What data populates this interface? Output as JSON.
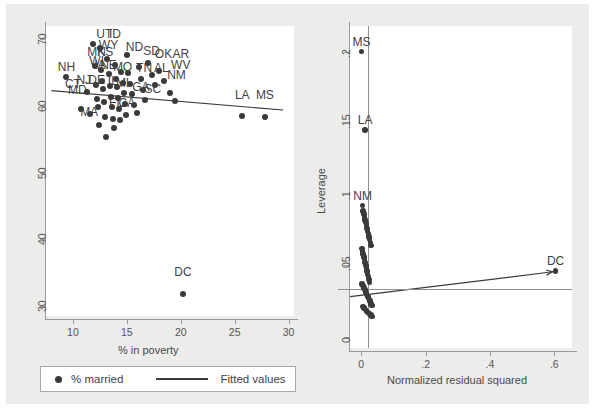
{
  "figure": {
    "background_color": "#ececeb",
    "plot_background": "#ffffff",
    "marker_color": "#3a3a3a",
    "axis_color": "#9a9a9a"
  },
  "legend": {
    "marker_label": "% married",
    "line_label": "Fitted values"
  },
  "chart_data": [
    {
      "type": "scatter",
      "panel": "left",
      "title": "",
      "xlabel": "% in poverty",
      "ylabel": "",
      "xlim": [
        7.5,
        30.5
      ],
      "ylim": [
        28.5,
        72.0
      ],
      "xticks": [
        "10",
        "15",
        "20",
        "25",
        "30"
      ],
      "xtick_values": [
        10,
        15,
        20,
        25,
        30
      ],
      "yticks": [
        "70",
        "60",
        "50",
        "40",
        "30"
      ],
      "ytick_values": [
        70,
        60,
        50,
        40,
        30
      ],
      "grid": false,
      "legend_position": "below",
      "series": [
        {
          "name": "% married",
          "x": [
            9.4,
            10.7,
            11.3,
            11.6,
            11.9,
            12.0,
            12.1,
            12.2,
            12.3,
            12.4,
            12.5,
            12.6,
            12.7,
            12.8,
            12.9,
            13.0,
            13.1,
            13.2,
            13.3,
            13.4,
            13.5,
            13.6,
            13.7,
            13.8,
            13.9,
            14.0,
            14.1,
            14.2,
            14.3,
            14.4,
            14.5,
            14.6,
            14.7,
            14.8,
            14.9,
            15.0,
            15.1,
            15.3,
            15.5,
            15.7,
            15.9,
            16.1,
            16.3,
            16.5,
            16.7,
            17.0,
            17.3,
            17.6,
            18.0,
            18.4,
            19.0,
            19.5,
            20.2,
            25.7,
            27.8
          ],
          "y": [
            64.3,
            59.6,
            62.1,
            58.8,
            69.3,
            66.0,
            63.2,
            61.0,
            59.9,
            57.2,
            68.7,
            65.4,
            63.8,
            62.5,
            60.6,
            58.4,
            55.3,
            67.0,
            64.8,
            63.0,
            61.4,
            59.8,
            58.0,
            56.7,
            66.2,
            64.1,
            62.8,
            61.2,
            59.5,
            57.9,
            65.1,
            63.4,
            62.0,
            60.3,
            58.6,
            67.6,
            64.9,
            63.3,
            61.8,
            60.1,
            58.9,
            65.8,
            64.0,
            62.4,
            60.9,
            66.4,
            64.6,
            63.1,
            65.2,
            63.7,
            62.0,
            60.7,
            31.8,
            58.5,
            58.3
          ],
          "marker": "filled-circle"
        }
      ],
      "fit_line": {
        "name": "Fitted values",
        "x0": 8.0,
        "y0": 62.3,
        "x1": 29.5,
        "y1": 59.4
      },
      "point_labels": [
        {
          "text": "UT",
          "x": 12.9,
          "y": 69.3
        },
        {
          "text": "ID",
          "x": 13.9,
          "y": 69.3
        },
        {
          "text": "NH",
          "x": 9.4,
          "y": 64.3
        },
        {
          "text": "WY",
          "x": 13.3,
          "y": 67.6
        },
        {
          "text": "MN",
          "x": 12.2,
          "y": 66.6
        },
        {
          "text": "KS",
          "x": 13.0,
          "y": 66.6
        },
        {
          "text": "ND",
          "x": 15.7,
          "y": 67.4
        },
        {
          "text": "SD",
          "x": 17.3,
          "y": 66.8
        },
        {
          "text": "OK",
          "x": 18.4,
          "y": 66.3
        },
        {
          "text": "AR",
          "x": 20.0,
          "y": 66.3
        },
        {
          "text": "WV",
          "x": 20.0,
          "y": 64.6
        },
        {
          "text": "WI",
          "x": 12.2,
          "y": 65.2
        },
        {
          "text": "IA",
          "x": 12.5,
          "y": 64.6
        },
        {
          "text": "NE",
          "x": 13.3,
          "y": 64.6
        },
        {
          "text": "MO",
          "x": 14.6,
          "y": 64.4
        },
        {
          "text": "TN",
          "x": 16.6,
          "y": 64.2
        },
        {
          "text": "AL",
          "x": 18.2,
          "y": 64.2
        },
        {
          "text": "NM",
          "x": 19.6,
          "y": 63.2
        },
        {
          "text": "CT",
          "x": 10.0,
          "y": 61.8
        },
        {
          "text": "NJ",
          "x": 11.0,
          "y": 62.4
        },
        {
          "text": "DE",
          "x": 12.2,
          "y": 62.4
        },
        {
          "text": "MD",
          "x": 10.4,
          "y": 60.9
        },
        {
          "text": "IL",
          "x": 13.7,
          "y": 62.3
        },
        {
          "text": "MI",
          "x": 14.6,
          "y": 62.0
        },
        {
          "text": "GA",
          "x": 16.3,
          "y": 61.3
        },
        {
          "text": "SC",
          "x": 17.4,
          "y": 61.1
        },
        {
          "text": "MA",
          "x": 11.5,
          "y": 57.6
        },
        {
          "text": "FL",
          "x": 14.0,
          "y": 59.0
        },
        {
          "text": "CA",
          "x": 15.0,
          "y": 59.0
        },
        {
          "text": "LA",
          "x": 25.7,
          "y": 60.1
        },
        {
          "text": "MS",
          "x": 27.8,
          "y": 60.1
        },
        {
          "text": "DC",
          "x": 20.2,
          "y": 33.6
        }
      ]
    },
    {
      "type": "scatter",
      "panel": "right",
      "title": "",
      "xlabel": "Normalized residual squared",
      "ylabel": "Leverage",
      "xlim": [
        -0.035,
        0.655
      ],
      "ylim": [
        -0.008,
        0.218
      ],
      "xticks": [
        "0",
        ".2",
        ".4",
        ".6"
      ],
      "xtick_values": [
        0,
        0.2,
        0.4,
        0.6
      ],
      "yticks": [
        "0",
        ".05",
        ".1",
        ".15",
        ".2"
      ],
      "ytick_values": [
        0,
        0.05,
        0.1,
        0.15,
        0.2
      ],
      "grid": false,
      "legend_position": "none",
      "series": [
        {
          "name": "Leverage vs normalized residual squared",
          "x": [
            0.001,
            0.012,
            0.004,
            0.006,
            0.008,
            0.01,
            0.012,
            0.014,
            0.016,
            0.018,
            0.02,
            0.022,
            0.024,
            0.026,
            0.028,
            0.03,
            0.002,
            0.004,
            0.006,
            0.008,
            0.01,
            0.012,
            0.014,
            0.016,
            0.018,
            0.02,
            0.022,
            0.024,
            0.026,
            0.003,
            0.005,
            0.007,
            0.009,
            0.011,
            0.013,
            0.015,
            0.017,
            0.019,
            0.021,
            0.023,
            0.025,
            0.027,
            0.029,
            0.031,
            0.033,
            0.005,
            0.009,
            0.013,
            0.017,
            0.021,
            0.025,
            0.03,
            0.034,
            0.604
          ],
          "y": [
            0.2,
            0.145,
            0.092,
            0.088,
            0.086,
            0.084,
            0.082,
            0.08,
            0.078,
            0.076,
            0.074,
            0.072,
            0.07,
            0.068,
            0.066,
            0.064,
            0.062,
            0.06,
            0.058,
            0.056,
            0.054,
            0.052,
            0.05,
            0.048,
            0.046,
            0.044,
            0.042,
            0.04,
            0.038,
            0.037,
            0.036,
            0.035,
            0.034,
            0.033,
            0.032,
            0.031,
            0.03,
            0.029,
            0.028,
            0.027,
            0.026,
            0.025,
            0.024,
            0.023,
            0.022,
            0.021,
            0.02,
            0.019,
            0.018,
            0.017,
            0.016,
            0.015,
            0.014,
            0.046
          ],
          "marker": "filled-circle"
        }
      ],
      "reference_lines": {
        "horizontal_y": 0.0335,
        "vertical_x": 0.0195
      },
      "fit_line": {
        "x0": -0.035,
        "y0": 0.028,
        "x1": 0.595,
        "y1": 0.0455
      },
      "point_labels": [
        {
          "text": "MS",
          "x": 0.001,
          "y": 0.2
        },
        {
          "text": "LA",
          "x": 0.012,
          "y": 0.145
        },
        {
          "text": "NM",
          "x": 0.004,
          "y": 0.092
        },
        {
          "text": "DC",
          "x": 0.604,
          "y": 0.046
        }
      ]
    }
  ]
}
